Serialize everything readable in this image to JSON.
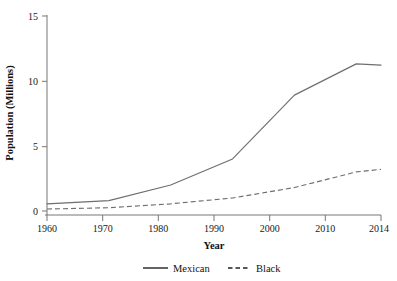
{
  "chart_data": {
    "type": "line",
    "title": "",
    "xlabel": "Year",
    "ylabel": "Population (Millions)",
    "x": [
      1960,
      1970,
      1980,
      1990,
      2000,
      2010,
      2014
    ],
    "xtick_labels": [
      "1960",
      "1970",
      "1980",
      "1990",
      "2000",
      "2010",
      "2014"
    ],
    "ytick_labels": [
      "0",
      "5",
      "10",
      "15"
    ],
    "yticks": [
      0,
      5,
      10,
      15
    ],
    "xlim": [
      1960,
      2014
    ],
    "ylim": [
      0,
      15
    ],
    "grid": false,
    "legend_position": "below-axis-center",
    "series": [
      {
        "name": "Mexican",
        "style": "solid",
        "color": "#6e6e6e",
        "values": [
          0.55,
          0.8,
          2.0,
          4.0,
          8.9,
          11.3,
          11.2
        ]
      },
      {
        "name": "Black",
        "style": "dashed",
        "color": "#6e6e6e",
        "values": [
          0.15,
          0.25,
          0.55,
          1.0,
          1.8,
          3.0,
          3.2
        ]
      }
    ]
  },
  "legend": {
    "items": [
      {
        "label": "Mexican",
        "style": "solid"
      },
      {
        "label": "Black",
        "style": "dashed"
      }
    ]
  }
}
